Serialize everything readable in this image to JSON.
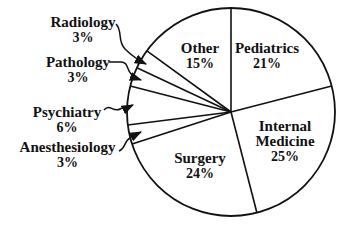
{
  "chart_data": {
    "type": "pie",
    "title": "",
    "start": "top",
    "direction": "clockwise",
    "legend": "none",
    "slices": [
      {
        "label": "Pediatrics",
        "value": 21,
        "display": "21%"
      },
      {
        "label": "Internal Medicine",
        "value": 25,
        "display": "25%",
        "display_lines": [
          "Internal",
          "Medicine"
        ]
      },
      {
        "label": "Surgery",
        "value": 24,
        "display": "24%"
      },
      {
        "label": "Anesthesiology",
        "value": 3,
        "display": "3%"
      },
      {
        "label": "Psychiatry",
        "value": 6,
        "display": "6%"
      },
      {
        "label": "Pathology",
        "value": 3,
        "display": "3%"
      },
      {
        "label": "Radiology",
        "value": 3,
        "display": "3%"
      },
      {
        "label": "Other",
        "value": 15,
        "display": "15%"
      }
    ],
    "colors": {
      "stroke": "#111111",
      "fill": "#ffffff",
      "text": "#111111",
      "background": "#ffffff"
    }
  }
}
